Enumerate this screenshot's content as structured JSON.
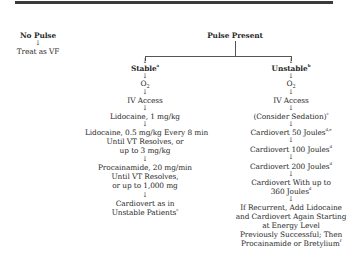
{
  "header": {
    "bar_color": "#3a3a3a"
  },
  "left_branch": {
    "title": "No Pulse",
    "action": "Treat as VF"
  },
  "root": {
    "title": "Pulse Present"
  },
  "stable": {
    "title": "Stable",
    "title_note": "a",
    "steps": [
      {
        "text": "O",
        "sub": "2"
      },
      {
        "text": "IV Access"
      },
      {
        "text": "Lidocaine, 1 mg/kg"
      },
      {
        "lines": [
          "Lidocaine, 0.5 mg/kg Every 8 min",
          "Until VT Resolves, or",
          "up to 3 mg/kg"
        ]
      },
      {
        "lines": [
          "Procainamide, 20 mg/min",
          "Until VT Resolves,",
          "or up to 1,000 mg"
        ]
      },
      {
        "lines": [
          "Cardiovert as in",
          "Unstable Patients"
        ],
        "note": "c"
      }
    ]
  },
  "unstable": {
    "title": "Unstable",
    "title_note": "b",
    "steps": [
      {
        "text": "O",
        "sub": "2"
      },
      {
        "text": "IV Access"
      },
      {
        "text": "(Consider Sedation)",
        "note": "c"
      },
      {
        "text": "Cardiovert 50 Joules",
        "note": "d,e"
      },
      {
        "text": "Cardiovert 100 Joules",
        "note": "d"
      },
      {
        "text": "Cardiovert 200 Joules",
        "note": "d"
      },
      {
        "lines": [
          "Cardiovert With up to",
          "360 Joules"
        ],
        "note": "d"
      },
      {
        "lines": [
          "If Recurrent, Add Lidocaine",
          "and Cardiovert Again Starting",
          "at Energy Level",
          "Previously Successful; Then",
          "Procainamide or Bretylium"
        ],
        "note": "f"
      }
    ]
  },
  "arrow_glyph": "↓"
}
